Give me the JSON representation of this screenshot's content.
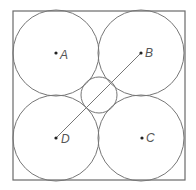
{
  "diagram": {
    "square": {
      "x": 13,
      "y": 11,
      "w": 172,
      "h": 169
    },
    "stroke_color": "#6a6a6a",
    "large_radius": 43,
    "small_circle": {
      "cx": 99,
      "cy": 95,
      "r": 18
    },
    "points": [
      {
        "label": "A",
        "cx": 56,
        "cy": 53
      },
      {
        "label": "B",
        "cx": 141,
        "cy": 53
      },
      {
        "label": "C",
        "cx": 142,
        "cy": 138
      },
      {
        "label": "D",
        "cx": 56,
        "cy": 138
      }
    ],
    "segment": {
      "from": "D",
      "to": "B"
    }
  }
}
